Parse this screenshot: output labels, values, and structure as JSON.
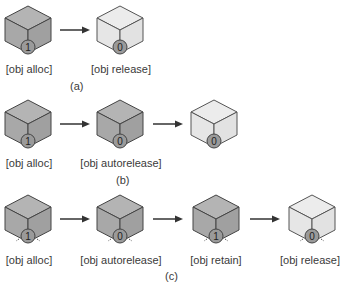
{
  "colors": {
    "retained_face": "#a8a8a8",
    "retained_top": "#b4b4b4",
    "released_face": "#e6e6e6",
    "released_top": "#ececec",
    "edge": "#444444",
    "counter_fill": "#9a9a9a",
    "arrow": "#333333"
  },
  "panels": [
    {
      "caption": "(a)",
      "steps": [
        {
          "label": "[obj alloc]",
          "count": "1",
          "state": "retained"
        },
        {
          "label": "[obj release]",
          "count": "0",
          "state": "released"
        }
      ]
    },
    {
      "caption": "(b)",
      "steps": [
        {
          "label": "[obj alloc]",
          "count": "1",
          "state": "retained"
        },
        {
          "label": "[obj autorelease]",
          "count": "0",
          "state": "retained"
        },
        {
          "label": "",
          "count": "0",
          "state": "released"
        }
      ]
    },
    {
      "caption": "(c)",
      "steps": [
        {
          "label": "[obj alloc]",
          "count": "1",
          "state": "retained",
          "cycle_marks": true
        },
        {
          "label": "[obj autorelease]",
          "count": "0",
          "state": "retained",
          "cycle_marks": true
        },
        {
          "label": "[obj retain]",
          "count": "1",
          "state": "retained",
          "cycle_marks": true
        },
        {
          "label": "[obj release]",
          "count": "0",
          "state": "released",
          "cycle_marks": true
        }
      ]
    }
  ]
}
